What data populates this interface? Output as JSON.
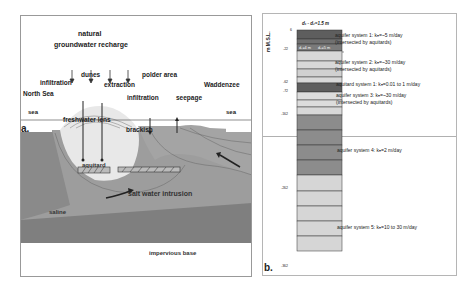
{
  "panel_a": {
    "label": "a.",
    "texts": {
      "recharge_line1": "natural",
      "recharge_line2": "groundwater recharge",
      "dunes": "dunes",
      "infiltration_left": "infiltration",
      "extraction": "extraction",
      "polder_area": "polder area",
      "waddenzee": "Waddenzee",
      "north_sea": "North Sea",
      "sea_left": "sea",
      "sea_right": "sea",
      "infiltration_right": "infiltration",
      "seepage": "seepage",
      "freshwater_lens": "freshwater lens",
      "brackish": "brackish",
      "aquitard": "aquitard",
      "salt_water_intrusion": "salt water intrusion",
      "saline": "saline",
      "impervious_base": "impervious base"
    },
    "colors": {
      "fresh": "#e4e4e4",
      "brackish": "#a9a9a9",
      "saline": "#9a9a9a",
      "base": "#7d7d7d"
    }
  },
  "panel_b": {
    "label": "b.",
    "axis_label": "m M.S.L.",
    "top_label": "d₁ - d₂=1.5 m",
    "inner_labels": [
      "d₁=4 m",
      "d₂=5 m"
    ],
    "depths": [
      "6",
      "-22",
      "-62",
      "-72",
      "-162",
      "-262",
      "-362"
    ],
    "systems": [
      {
        "line1": "aquifer system 1: kₕ=~5 m/day",
        "line2": "(intersected by aquitards)"
      },
      {
        "line1": "aquifer system 2: kₕ=~30 m/day",
        "line2": "(intersected by aquitards)"
      },
      {
        "line1": "aquitard system 1: kₕ=0.01 to 1 m/day",
        "line2": ""
      },
      {
        "line1": "aquifer system 3: kₕ=~30 m/day",
        "line2": "(intersected by aquitards)"
      },
      {
        "line1": "aquifer system 4: kₕ=2 m/day",
        "line2": ""
      },
      {
        "line1": "aquifer system 5: kₕ=10 to 30 m/day",
        "line2": ""
      }
    ],
    "colors": {
      "dark": "#5f5f5f",
      "mid": "#8c8c8c",
      "light": "#d6d6d6"
    }
  }
}
